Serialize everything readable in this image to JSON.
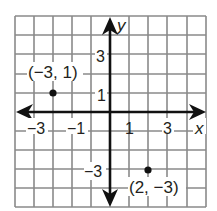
{
  "graph": {
    "x_axis_label": "x",
    "y_axis_label": "y",
    "x_range": [
      -5,
      5
    ],
    "y_range": [
      -5,
      5
    ],
    "x_tick_labels": [
      "-3",
      "-1",
      "1",
      "3"
    ],
    "y_tick_labels": [
      "3",
      "1",
      "-3"
    ],
    "grid_color": "#8a8a8a",
    "axis_color": "#111111"
  },
  "points": [
    {
      "label": "(−3, 1)",
      "x": -3,
      "y": 1
    },
    {
      "label": "(2, −3)",
      "x": 2,
      "y": -3
    }
  ],
  "labels": {
    "xt_m3": "−3",
    "xt_m1": "−1",
    "xt_1": "1",
    "xt_3": "3",
    "yt_3": "3",
    "yt_1": "1",
    "yt_m3": "−3",
    "x": "x",
    "y": "y",
    "p1": "(−3, 1)",
    "p2": "(2, −3)"
  }
}
